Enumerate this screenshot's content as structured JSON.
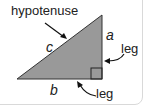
{
  "diagram": {
    "title_label": "hypotenuse",
    "side_hyp": "c",
    "side_vertical": "a",
    "side_horizontal": "b",
    "leg_label_right": "leg",
    "leg_label_bottom": "leg",
    "colors": {
      "triangle_fill": "#999999",
      "triangle_stroke": "#333333",
      "text": "#222222"
    }
  }
}
